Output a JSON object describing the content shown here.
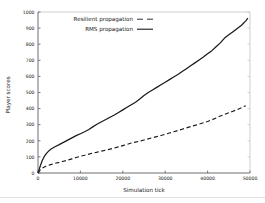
{
  "chart_data": {
    "type": "line",
    "title": "",
    "xlabel": "Simulation tick",
    "ylabel": "Player scores",
    "xlim": [
      0,
      50000
    ],
    "ylim": [
      0,
      1000
    ],
    "xticks": [
      0,
      10000,
      20000,
      30000,
      40000,
      50000
    ],
    "xtick_labels": [
      "0",
      "10000",
      "20000",
      "30000",
      "40000",
      "50000"
    ],
    "yticks": [
      0,
      100,
      200,
      300,
      400,
      500,
      600,
      700,
      800,
      900,
      1000
    ],
    "ytick_labels": [
      "0",
      "100",
      "200",
      "300",
      "400",
      "500",
      "600",
      "700",
      "800",
      "900",
      "1000"
    ],
    "grid": false,
    "legend_position": "upper left",
    "series": [
      {
        "name": "Resilient propagation",
        "style": "dashed",
        "color": "#1a1a1a",
        "x": [
          0,
          500,
          1000,
          2000,
          3000,
          4000,
          5000,
          6000,
          7000,
          8000,
          9000,
          10000,
          11000,
          12000,
          13000,
          14000,
          15000,
          16000,
          17000,
          18000,
          19000,
          20000,
          21000,
          22000,
          23000,
          24000,
          25000,
          26000,
          27000,
          28000,
          29000,
          30000,
          31000,
          32000,
          33000,
          34000,
          35000,
          36000,
          37000,
          38000,
          39000,
          40000,
          41000,
          42000,
          43000,
          44000,
          45000,
          46000,
          47000,
          48000,
          49000
        ],
        "y": [
          0,
          18,
          30,
          44,
          52,
          60,
          66,
          73,
          80,
          88,
          96,
          104,
          110,
          117,
          124,
          130,
          136,
          142,
          148,
          155,
          162,
          170,
          178,
          186,
          192,
          198,
          205,
          212,
          219,
          226,
          233,
          240,
          248,
          256,
          264,
          272,
          280,
          288,
          296,
          304,
          312,
          320,
          330,
          342,
          354,
          364,
          374,
          384,
          394,
          406,
          418
        ]
      },
      {
        "name": "RMS propagation",
        "style": "solid",
        "color": "#1a1a1a",
        "x": [
          0,
          500,
          1000,
          1500,
          2000,
          2500,
          3000,
          4000,
          5000,
          6000,
          7000,
          8000,
          9000,
          10000,
          11000,
          12000,
          13000,
          14000,
          15000,
          16000,
          17000,
          18000,
          19000,
          20000,
          21000,
          22000,
          23000,
          24000,
          25000,
          26000,
          27000,
          28000,
          29000,
          30000,
          31000,
          32000,
          33000,
          34000,
          35000,
          36000,
          37000,
          38000,
          39000,
          40000,
          41000,
          42000,
          43000,
          44000,
          45000,
          46000,
          47000,
          48000,
          49000,
          49500
        ],
        "y": [
          0,
          40,
          78,
          104,
          122,
          136,
          148,
          163,
          176,
          190,
          204,
          218,
          232,
          244,
          256,
          270,
          288,
          304,
          318,
          332,
          346,
          360,
          376,
          392,
          408,
          424,
          440,
          460,
          482,
          500,
          516,
          532,
          548,
          564,
          580,
          596,
          612,
          630,
          648,
          666,
          684,
          702,
          720,
          740,
          760,
          784,
          808,
          838,
          858,
          878,
          898,
          918,
          945,
          962
        ]
      }
    ]
  },
  "legend": {
    "entries": [
      {
        "label": "Resilient propagation",
        "style": "dashed"
      },
      {
        "label": "RMS propagation",
        "style": "solid"
      }
    ]
  },
  "axes": {
    "x_title": "Simulation tick",
    "y_title": "Player scores"
  }
}
